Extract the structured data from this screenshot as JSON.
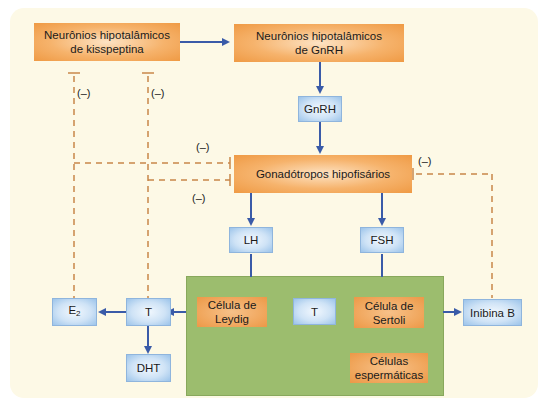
{
  "diagram": {
    "nodes": {
      "kisspeptin": {
        "line1": "Neurônios hipotalâmicos",
        "line2": "de kisspeptina"
      },
      "gnrh_neurons": {
        "line1": "Neurônios hipotalâmicos",
        "line2": "de GnRH"
      },
      "gnrh": "GnRH",
      "gonadotropos": "Gonadótropos hipofisários",
      "lh": "LH",
      "fsh": "FSH",
      "leydig": {
        "line1": "Célula de",
        "line2": "Leydig"
      },
      "t_inner": "T",
      "sertoli": {
        "line1": "Célula de",
        "line2": "Sertoli"
      },
      "spermatic": {
        "line1": "Células",
        "line2": "espermáticas"
      },
      "inhibin_b": "Inibina B",
      "t_outer": "T",
      "e2_base": "E",
      "e2_sub": "2",
      "dht": "DHT"
    },
    "labels": {
      "neg1": "(–)",
      "neg2": "(–)",
      "neg3": "(–)",
      "neg4": "(–)",
      "neg5": "(–)"
    },
    "colors": {
      "orange_box": "#f0a55a",
      "blue_box": "#cfe3f6",
      "green_region": "#9cbd6e",
      "arrow_blue": "#3a5ba8",
      "inhibition_dashed": "#c8874a",
      "background": "#fdf9e6"
    }
  }
}
